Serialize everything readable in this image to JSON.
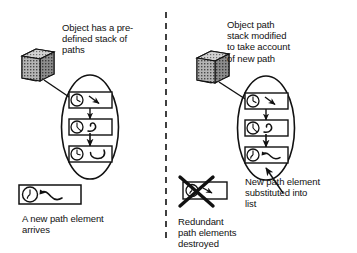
{
  "diagram": {
    "divider": {
      "name": "vertical-dashed-divider",
      "x": 166
    },
    "left_panel": {
      "caption_top": "Object has a pre-\ndefined stack of\npaths",
      "caption_bottom": "A new path element\narrives",
      "object_icon": "cube-icon",
      "stack_items": [
        {
          "icon": "clock-icon",
          "path_glyph": "arrow-down-right-stroke"
        },
        {
          "icon": "clock-icon",
          "path_glyph": "hook-curve-stroke"
        },
        {
          "icon": "clock-icon",
          "path_glyph": "c-curve-stroke"
        }
      ],
      "new_element": {
        "icon": "clock-icon",
        "path_glyph": "wave-curve-stroke"
      }
    },
    "right_panel": {
      "caption_top": "Object path\nstack modified\nto take account\nof new path",
      "caption_destroyed": "Redundant\npath elements\ndestroyed",
      "caption_substituted": "New path element\nsubstituted into\nlist",
      "object_icon": "cube-icon",
      "stack_items": [
        {
          "icon": "clock-icon",
          "path_glyph": "arrow-down-right-stroke"
        },
        {
          "icon": "clock-icon",
          "path_glyph": "hook-curve-stroke"
        },
        {
          "icon": "clock-icon",
          "path_glyph": "wave-curve-stroke"
        }
      ],
      "destroyed_element": {
        "icon": "clock-icon",
        "path_glyph": "arrow-stroke",
        "overlay": "x-cross-icon"
      }
    },
    "colors": {
      "ink": "#111111",
      "background": "#ffffff",
      "cube_fill": "#9a9a9a"
    }
  }
}
